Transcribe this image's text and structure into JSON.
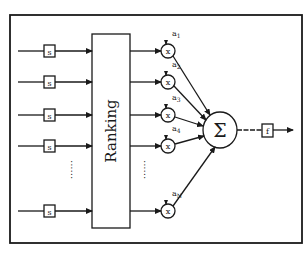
{
  "diagram": {
    "type": "block-diagram",
    "ranking_block": {
      "label": "Ranking"
    },
    "input_block_label": "s",
    "multiplier_symbol": "x",
    "sum_symbol": "Σ",
    "output_block_label": "f",
    "ellipsis": "......",
    "rows": [
      {
        "id": "row-1",
        "weight": "a",
        "sub": "1"
      },
      {
        "id": "row-2",
        "weight": "a",
        "sub": "2"
      },
      {
        "id": "row-3",
        "weight": "a",
        "sub": "3"
      },
      {
        "id": "row-4",
        "weight": "a",
        "sub": "4"
      },
      {
        "id": "row-N",
        "weight": "a",
        "sub": "N"
      }
    ]
  }
}
